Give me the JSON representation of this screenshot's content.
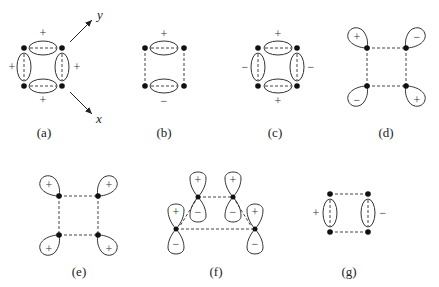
{
  "figure": {
    "panels": [
      {
        "id": "a",
        "label": "(a)",
        "signs": [
          "+",
          "+",
          "+",
          "+"
        ],
        "axes": {
          "x": "x",
          "y": "y"
        }
      },
      {
        "id": "b",
        "label": "(b)",
        "signs": [
          "+",
          "−"
        ]
      },
      {
        "id": "c",
        "label": "(c)",
        "signs": [
          "+",
          "−",
          "−",
          "+"
        ]
      },
      {
        "id": "d",
        "label": "(d)",
        "signs": [
          "+",
          "−",
          "−",
          "+"
        ]
      },
      {
        "id": "e",
        "label": "(e)",
        "signs": [
          "+",
          "+",
          "+",
          "+"
        ]
      },
      {
        "id": "f",
        "label": "(f)",
        "signs": [
          "+",
          "−",
          "+",
          "−",
          "+",
          "−",
          "+",
          "−"
        ]
      },
      {
        "id": "g",
        "label": "(g)",
        "signs": [
          "+",
          "−"
        ]
      }
    ]
  }
}
